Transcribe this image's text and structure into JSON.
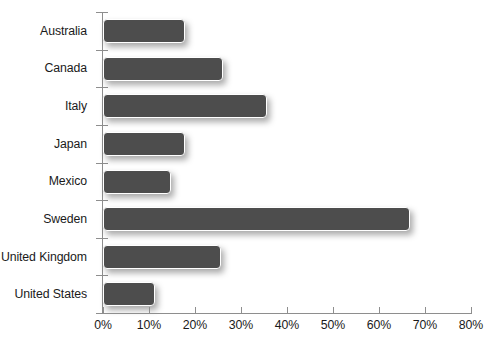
{
  "chart_data": {
    "type": "bar",
    "orientation": "horizontal",
    "title": "",
    "subtitle": "",
    "xlabel": "",
    "ylabel": "",
    "categories": [
      "Australia",
      "Canada",
      "Italy",
      "Japan",
      "Mexico",
      "Sweden",
      "United Kingdom",
      "United States"
    ],
    "values": [
      17.8,
      26.0,
      35.7,
      17.8,
      14.8,
      66.8,
      25.6,
      11.2
    ],
    "value_unit": "%",
    "xlim": [
      0,
      80
    ],
    "x_tick_labels": [
      "0%",
      "10%",
      "20%",
      "30%",
      "40%",
      "50%",
      "60%",
      "70%",
      "80%"
    ],
    "x_tick_values": [
      0,
      10,
      20,
      30,
      40,
      50,
      60,
      70,
      80
    ],
    "grid": false,
    "legend": null,
    "series": [
      {
        "name": "",
        "values": [
          17.8,
          26.0,
          35.7,
          17.8,
          14.8,
          66.8,
          25.6,
          11.2
        ]
      }
    ]
  },
  "style": {
    "background": "#ffffff",
    "bar_fill": "#4d4d4d",
    "bar_border": "#ffffff",
    "axis_color": "#8e8e8e",
    "text_color": "#1a1a1a"
  }
}
